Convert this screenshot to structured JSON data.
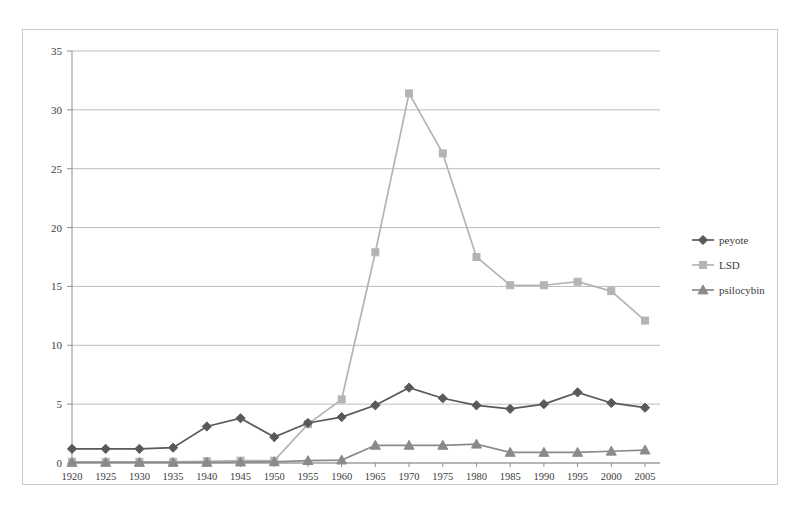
{
  "chart_data": {
    "type": "line",
    "title": "",
    "subtitle": "",
    "xlabel": "",
    "ylabel": "",
    "xlim": [
      1920,
      2005
    ],
    "ylim": [
      0,
      35
    ],
    "ytick_step": 5,
    "grid": true,
    "grid_axis": "y",
    "legend_position": "right",
    "categories": [
      1920,
      1925,
      1930,
      1935,
      1940,
      1945,
      1950,
      1955,
      1960,
      1965,
      1970,
      1975,
      1980,
      1985,
      1990,
      1995,
      2000,
      2005
    ],
    "x_tick_labels": [
      "1920",
      "1925",
      "1930",
      "1935",
      "1940",
      "1945",
      "1950",
      "1955",
      "1960",
      "1965",
      "1970",
      "1975",
      "1980",
      "1985",
      "1990",
      "1995",
      "2000",
      "2005"
    ],
    "y_tick_labels": [
      "0",
      "5",
      "10",
      "15",
      "20",
      "25",
      "30",
      "35"
    ],
    "y_tick_values": [
      0,
      5,
      10,
      15,
      20,
      25,
      30,
      35
    ],
    "series": [
      {
        "name": "peyote",
        "color": "#595959",
        "marker": "diamond",
        "values": [
          1.2,
          1.2,
          1.2,
          1.3,
          3.1,
          3.8,
          2.2,
          3.4,
          3.9,
          4.9,
          6.4,
          5.5,
          4.9,
          4.6,
          5.0,
          6.0,
          5.1,
          4.7
        ]
      },
      {
        "name": "LSD",
        "color": "#b4b4b4",
        "marker": "square",
        "values": [
          0.1,
          0.1,
          0.1,
          0.1,
          0.15,
          0.2,
          0.2,
          3.3,
          5.4,
          17.9,
          31.4,
          26.3,
          17.5,
          15.1,
          15.1,
          15.4,
          14.6,
          12.1
        ]
      },
      {
        "name": "psilocybin",
        "color": "#8a8a8a",
        "marker": "triangle",
        "values": [
          0.05,
          0.05,
          0.05,
          0.05,
          0.05,
          0.08,
          0.1,
          0.2,
          0.25,
          1.5,
          1.5,
          1.5,
          1.6,
          0.9,
          0.9,
          0.9,
          1.0,
          1.1
        ]
      }
    ]
  },
  "legend": {
    "entries": [
      {
        "label": "peyote"
      },
      {
        "label": "LSD"
      },
      {
        "label": "psilocybin"
      }
    ]
  },
  "colors": {
    "peyote": "#595959",
    "lsd": "#b4b4b4",
    "psilocybin": "#8a8a8a",
    "gridline": "#b6b6b6",
    "axis": "#8f8f8f",
    "frame": "#c9c9c9",
    "text": "#3c3c3c",
    "background": "#ffffff"
  }
}
